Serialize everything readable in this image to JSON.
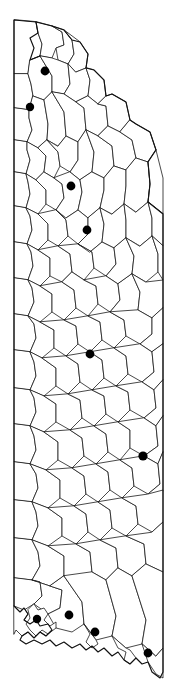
{
  "map": {
    "title": "County map with highlighted locations",
    "region_name": "Alabama",
    "background_color": "#ffffff",
    "boundary_color": "#1a1a1a",
    "marker_color": "#000000",
    "marker_shape": "filled-circle",
    "marker_radius_px": 4.2,
    "county_count_visible": 67,
    "legend": null,
    "labels": [],
    "width_px": 177,
    "height_px": 699,
    "markers": [
      {
        "id": "marker-1",
        "x": 45,
        "y": 71,
        "r": 4.4
      },
      {
        "id": "marker-2",
        "x": 30,
        "y": 107,
        "r": 4.2
      },
      {
        "id": "marker-3",
        "x": 71,
        "y": 186,
        "r": 4.4
      },
      {
        "id": "marker-4",
        "x": 87,
        "y": 230,
        "r": 4.4
      },
      {
        "id": "marker-5",
        "x": 90,
        "y": 354,
        "r": 4.4
      },
      {
        "id": "marker-6",
        "x": 143,
        "y": 456,
        "r": 4.6
      },
      {
        "id": "marker-7",
        "x": 37,
        "y": 619,
        "r": 4.2
      },
      {
        "id": "marker-8",
        "x": 69,
        "y": 615,
        "r": 4.4
      },
      {
        "id": "marker-9",
        "x": 95,
        "y": 632,
        "r": 4.4
      },
      {
        "id": "marker-10",
        "x": 148,
        "y": 653,
        "r": 4.4
      }
    ]
  }
}
